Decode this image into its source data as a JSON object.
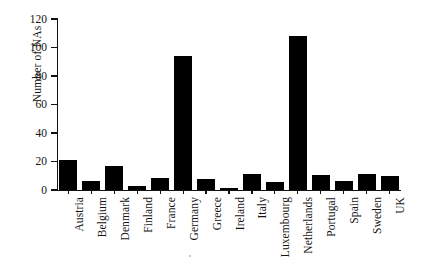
{
  "figure": {
    "background_color": "#ffffff",
    "bar_color": "#000000",
    "axis_color": "#111111"
  },
  "axes": {
    "ylabel": "Number of NAs",
    "xlabel": "",
    "yticks": [
      0,
      20,
      40,
      60,
      80,
      100,
      120
    ],
    "ytick_labels": [
      "0",
      "20",
      "40",
      "60",
      "80",
      "100",
      "120"
    ],
    "ymin": 0,
    "ymax": 120
  },
  "chart_data": {
    "type": "bar",
    "title": "",
    "xlabel": "",
    "ylabel": "Number of NAs",
    "ylim": [
      0,
      120
    ],
    "grid": false,
    "legend": false,
    "orientation": "vertical",
    "bar_color": "#000000",
    "categories": [
      "Austria",
      "Belgium",
      "Denmark",
      "Finland",
      "France",
      "Germany",
      "Greece",
      "Ireland",
      "Italy",
      "Luxembourg",
      "Netherlands",
      "Portugal",
      "Spain",
      "Sweden",
      "UK"
    ],
    "values": [
      21,
      6,
      17,
      3,
      8.5,
      94,
      8,
      1.5,
      11.5,
      5.5,
      108,
      10.5,
      6.5,
      11.5,
      10
    ]
  }
}
